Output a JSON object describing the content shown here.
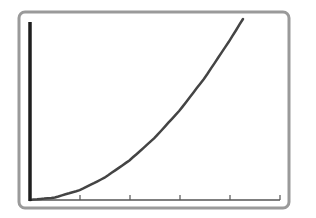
{
  "chart_data": {
    "type": "line",
    "title": "",
    "xlabel": "",
    "ylabel": "",
    "xlim": [
      0,
      5
    ],
    "ylim": [
      0,
      18
    ],
    "x_ticks": [
      0,
      1,
      2,
      3,
      4,
      5
    ],
    "x_tick_labels": [],
    "y_ticks": [],
    "grid": false,
    "legend": null,
    "series": [
      {
        "name": "curve",
        "x": [
          0,
          0.5,
          1,
          1.5,
          2,
          2.5,
          3,
          3.5,
          4,
          4.26
        ],
        "y": [
          0,
          0.25,
          1,
          2.25,
          4,
          6.25,
          9,
          12.25,
          16,
          18.1
        ]
      }
    ]
  },
  "style": {
    "frame_color": "#9a9a9a",
    "y_axis_color": "#1e1e1e",
    "x_axis_color": "#555555",
    "curve_color": "#444444",
    "background": "#ffffff"
  }
}
